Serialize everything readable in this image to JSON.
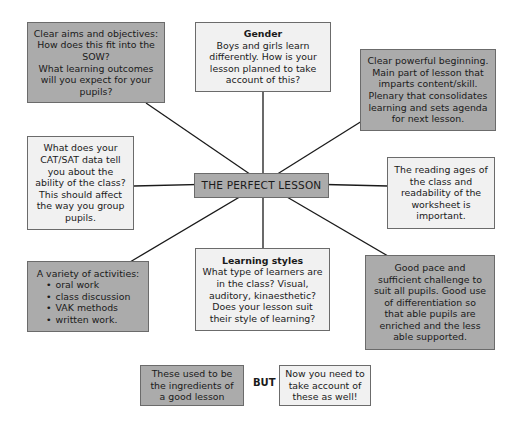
{
  "diagram": {
    "center": {
      "label": "THE PERFECT LESSON"
    },
    "nodes": {
      "aims": {
        "lines": [
          "Clear aims and objectives:",
          "How does this fit into the",
          "SOW?",
          "What learning outcomes",
          "will you expect for your",
          "pupils?"
        ]
      },
      "gender": {
        "title": "Gender",
        "lines": [
          "Boys and girls learn",
          "differently. How is your",
          "lesson planned to take",
          "account of this?"
        ]
      },
      "structure": {
        "lines": [
          "Clear powerful beginning.",
          "Main part of lesson that",
          "imparts content/skill.",
          "Plenary that consolidates",
          "learning and sets agenda",
          "for next lesson."
        ]
      },
      "data": {
        "lines": [
          "What does your",
          "CAT/SAT data tell",
          "you about the",
          "ability of the class?",
          "This should affect",
          "the way you group",
          "pupils."
        ]
      },
      "reading": {
        "lines": [
          "The reading ages of",
          "the class and",
          "readability of the",
          "worksheet is",
          "important."
        ]
      },
      "activities": {
        "title": "A variety of activities:",
        "bullets": [
          "oral work",
          "class discussion",
          "VAK methods",
          "written work."
        ]
      },
      "styles": {
        "title": "Learning styles",
        "lines": [
          "What type of learners are",
          "in the class? Visual,",
          "auditory, kinaesthetic?",
          "Does your lesson suit",
          "their style of learning?"
        ]
      },
      "pace": {
        "lines": [
          "Good pace and",
          "sufficient challenge to",
          "suit all pupils. Good use",
          "of differentiation so",
          "that able pupils are",
          "enriched and the less",
          "able supported."
        ]
      }
    },
    "legend": {
      "dark_box": {
        "lines": [
          "These used to be",
          "the ingredients of",
          "a good lesson"
        ]
      },
      "connector": "BUT",
      "light_box": {
        "lines": [
          "Now you need to",
          "take account of",
          "these as well!"
        ]
      }
    },
    "colors": {
      "dark_fill": "#ababab",
      "light_fill": "#f1f1f1",
      "border": "#6b6b6b",
      "line": "#1a1a1a"
    }
  }
}
